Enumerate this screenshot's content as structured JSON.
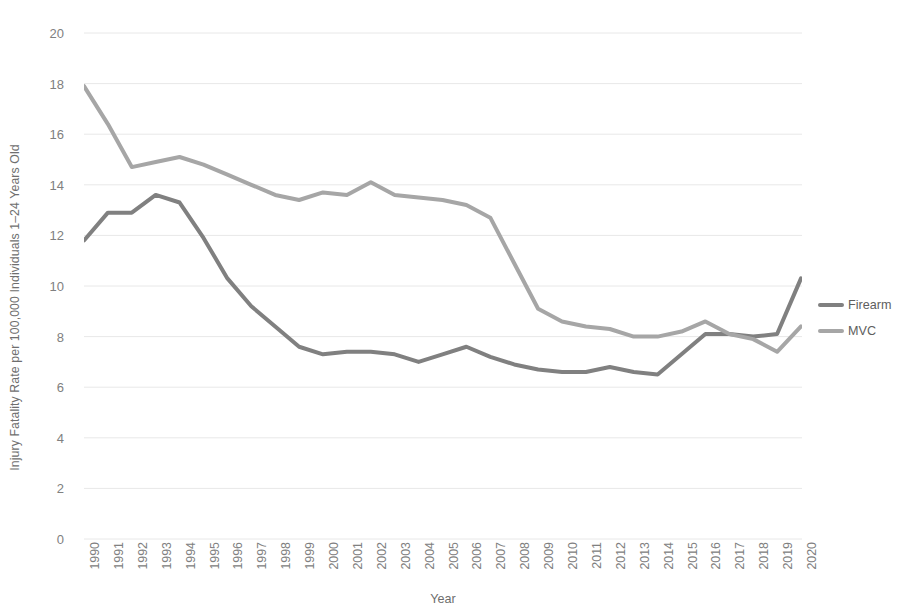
{
  "chart_data": {
    "type": "line",
    "title": "",
    "xlabel": "Year",
    "ylabel": "Injury Fatality Rate per 100,000 Individuals 1–24 Years Old",
    "x": [
      1990,
      1991,
      1992,
      1993,
      1994,
      1995,
      1996,
      1997,
      1998,
      1999,
      2000,
      2001,
      2002,
      2003,
      2004,
      2005,
      2006,
      2007,
      2008,
      2009,
      2010,
      2011,
      2012,
      2013,
      2014,
      2015,
      2016,
      2017,
      2018,
      2019,
      2020
    ],
    "xticklabels": [
      "1990",
      "1991",
      "1992",
      "1993",
      "1994",
      "1995",
      "1996",
      "1997",
      "1998",
      "1999",
      "2000",
      "2001",
      "2002",
      "2003",
      "2004",
      "2005",
      "2006",
      "2007",
      "2008",
      "2009",
      "2010",
      "2011",
      "2012",
      "2013",
      "2014",
      "2015",
      "2016",
      "2017",
      "2018",
      "2019",
      "2020"
    ],
    "yticks": [
      0,
      2,
      4,
      6,
      8,
      10,
      12,
      14,
      16,
      18,
      20
    ],
    "yticklabels": [
      "0",
      "2",
      "4",
      "6",
      "8",
      "10",
      "12",
      "14",
      "16",
      "18",
      "20"
    ],
    "ylim": [
      0,
      20
    ],
    "xlim": [
      1990,
      2020
    ],
    "grid": "horizontal",
    "legend_position": "right",
    "series": [
      {
        "name": "Firearm",
        "color": "#808080",
        "values": [
          11.8,
          12.9,
          12.9,
          13.6,
          13.3,
          11.9,
          10.3,
          9.2,
          8.4,
          7.6,
          7.3,
          7.4,
          7.4,
          7.3,
          7.0,
          7.3,
          7.6,
          7.2,
          6.9,
          6.7,
          6.6,
          6.6,
          6.8,
          6.6,
          6.5,
          7.3,
          8.1,
          8.1,
          8.0,
          8.1,
          10.3
        ]
      },
      {
        "name": "MVC",
        "color": "#a6a6a6",
        "values": [
          17.9,
          16.4,
          14.7,
          14.9,
          15.1,
          14.8,
          14.4,
          14.0,
          13.6,
          13.4,
          13.7,
          13.6,
          14.1,
          13.6,
          13.5,
          13.4,
          13.2,
          12.7,
          10.9,
          9.1,
          8.6,
          8.4,
          8.3,
          8.0,
          8.0,
          8.2,
          8.6,
          8.1,
          7.9,
          7.4,
          8.4
        ]
      }
    ]
  },
  "legend": {
    "items": [
      {
        "label": "Firearm"
      },
      {
        "label": "MVC"
      }
    ]
  },
  "colors": {
    "firearm": "#808080",
    "mvc": "#a6a6a6",
    "grid": "#e8e8e8",
    "tick_text": "#808080",
    "axis_title": "#6e6e6e",
    "background": "#ffffff"
  }
}
